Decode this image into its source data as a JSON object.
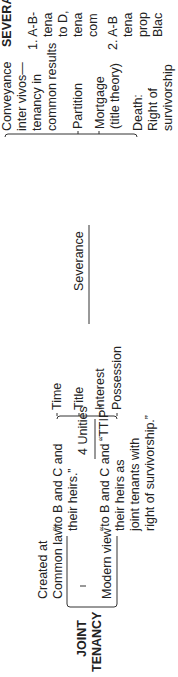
{
  "root": {
    "label_line1": "JOINT",
    "label_line2": "TENANCY"
  },
  "creation": {
    "common_law": {
      "label_line1": "Created at",
      "label_line2": "Common law",
      "example_line1": "“to B and C and",
      "example_line2": "their heirs.”"
    },
    "modern_view": {
      "label": "Modern view",
      "example_line1": "“to B and C and",
      "example_line2": "their heirs as",
      "example_line3": "joint tenants with",
      "example_line4": "right of survivorship.”"
    }
  },
  "unities": {
    "label": "4 Unities",
    "mnemonic": "“TTIP”",
    "items": [
      "Time",
      "Title",
      "Interest",
      "Possession"
    ]
  },
  "severance": {
    "label": "Severance",
    "items": [
      {
        "lines": [
          "Conveyance",
          "inter vivos—",
          "tenancy in",
          "common results"
        ]
      },
      {
        "lines": [
          "Partition"
        ]
      },
      {
        "lines": [
          "Mortgage",
          "(title theory)"
        ]
      },
      {
        "lines": [
          "Death:",
          "Right of",
          "survivorship"
        ]
      }
    ]
  },
  "side_panel": {
    "heading": "SEVERA",
    "item1_lines": [
      "1. A-B-",
      "tena",
      "to D,",
      "tena",
      "com"
    ],
    "item2_lines": [
      "2. A-B",
      "tena",
      "prop",
      "Blac"
    ]
  }
}
